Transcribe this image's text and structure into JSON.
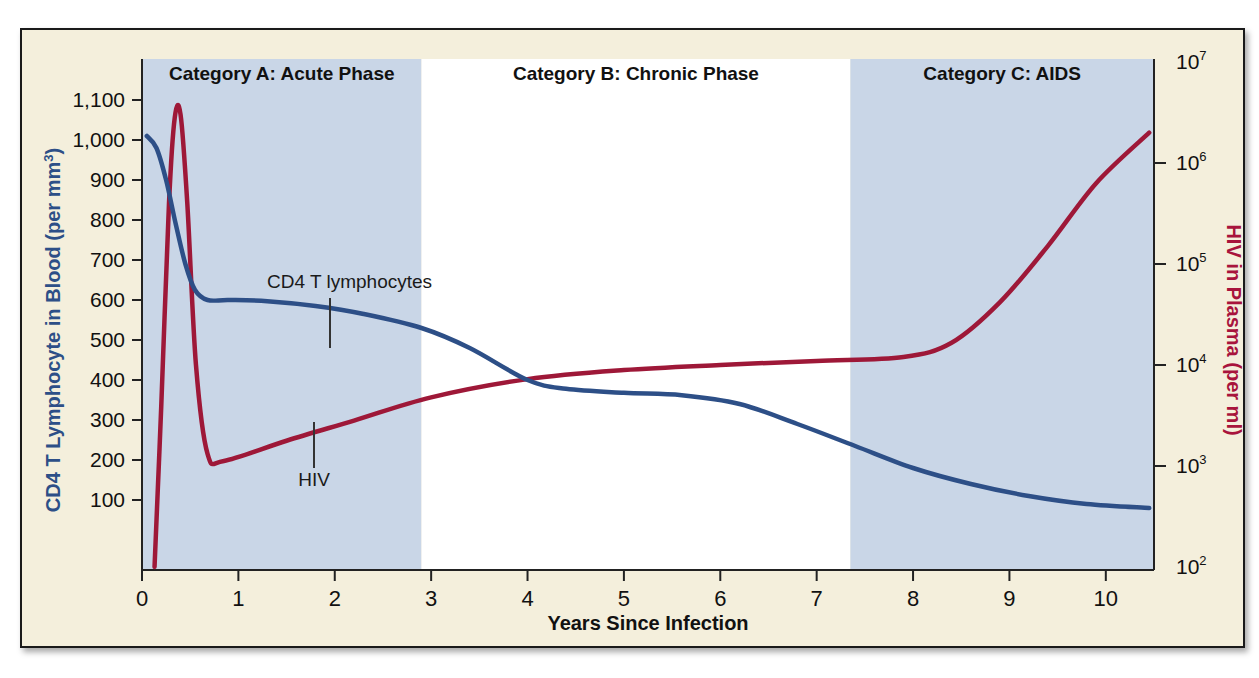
{
  "figure": {
    "background_color": "#f4efdc",
    "border_color": "#1a1a1a",
    "plot_background_color": "#ffffff",
    "shaded_band_color": "#c9d6e7"
  },
  "chart_data": {
    "type": "line",
    "title": "",
    "xlabel": "Years Since Infection",
    "ylabel_left": "CD4 T Lymphocyte in Blood (per mm",
    "ylabel_left_sup": "3",
    "ylabel_left_tail": ")",
    "ylabel_right": "HIV in Plasma (per ml)",
    "xlim": [
      0,
      10.5
    ],
    "xticks": [
      "0",
      "1",
      "2",
      "3",
      "4",
      "5",
      "6",
      "7",
      "8",
      "9",
      "10"
    ],
    "xtick_values": [
      0,
      1,
      2,
      3,
      4,
      5,
      6,
      7,
      8,
      9,
      10
    ],
    "ylim_left": [
      0,
      1200
    ],
    "yticks_left": [
      "1,100",
      "1,000",
      "900",
      "800",
      "700",
      "600",
      "500",
      "400",
      "300",
      "200",
      "100"
    ],
    "ytick_values_left": [
      1100,
      1000,
      900,
      800,
      700,
      600,
      500,
      400,
      300,
      200,
      100
    ],
    "ylim_right_log10": [
      2,
      7
    ],
    "yticks_right": [
      {
        "base": "10",
        "exp": "7",
        "value": 7
      },
      {
        "base": "10",
        "exp": "6",
        "value": 6
      },
      {
        "base": "10",
        "exp": "5",
        "value": 5
      },
      {
        "base": "10",
        "exp": "4",
        "value": 4
      },
      {
        "base": "10",
        "exp": "3",
        "value": 3
      },
      {
        "base": "10",
        "exp": "2",
        "value": 2
      }
    ],
    "grid": false,
    "legend_position": "inline-annotations",
    "bands": [
      {
        "id": "A",
        "label": "Category A:  Acute Phase",
        "x_start": 0,
        "x_end": 2.9,
        "shaded": true
      },
      {
        "id": "B",
        "label": "Category B: Chronic Phase",
        "x_start": 2.9,
        "x_end": 7.35,
        "shaded": false
      },
      {
        "id": "C",
        "label": "Category C: AIDS",
        "x_start": 7.35,
        "x_end": 10.5,
        "shaded": true
      }
    ],
    "series": [
      {
        "name": "CD4 T lymphocytes",
        "color": "#2d4f87",
        "axis": "left",
        "units": "cells per mm^3",
        "annotation": "CD4 T lymphocytes",
        "points": [
          {
            "x": 0.05,
            "y": 1010
          },
          {
            "x": 0.15,
            "y": 980
          },
          {
            "x": 0.25,
            "y": 900
          },
          {
            "x": 0.35,
            "y": 790
          },
          {
            "x": 0.45,
            "y": 690
          },
          {
            "x": 0.55,
            "y": 625
          },
          {
            "x": 0.68,
            "y": 600
          },
          {
            "x": 0.9,
            "y": 600
          },
          {
            "x": 1.3,
            "y": 597
          },
          {
            "x": 1.8,
            "y": 585
          },
          {
            "x": 2.3,
            "y": 565
          },
          {
            "x": 2.9,
            "y": 530
          },
          {
            "x": 3.4,
            "y": 480
          },
          {
            "x": 4.0,
            "y": 400
          },
          {
            "x": 4.4,
            "y": 378
          },
          {
            "x": 5.0,
            "y": 368
          },
          {
            "x": 5.6,
            "y": 362
          },
          {
            "x": 6.2,
            "y": 340
          },
          {
            "x": 6.8,
            "y": 290
          },
          {
            "x": 7.4,
            "y": 235
          },
          {
            "x": 8.0,
            "y": 180
          },
          {
            "x": 8.6,
            "y": 140
          },
          {
            "x": 9.2,
            "y": 110
          },
          {
            "x": 9.8,
            "y": 90
          },
          {
            "x": 10.45,
            "y": 80
          }
        ]
      },
      {
        "name": "HIV",
        "color": "#9e1838",
        "axis": "right",
        "units": "copies per ml",
        "annotation": "HIV",
        "points": [
          {
            "x": 0.13,
            "y_log10": 2.0
          },
          {
            "x": 0.2,
            "y_log10": 3.6
          },
          {
            "x": 0.28,
            "y_log10": 5.6
          },
          {
            "x": 0.34,
            "y_log10": 6.45
          },
          {
            "x": 0.4,
            "y_log10": 6.48
          },
          {
            "x": 0.47,
            "y_log10": 5.6
          },
          {
            "x": 0.56,
            "y_log10": 4.0
          },
          {
            "x": 0.68,
            "y_log10": 3.12
          },
          {
            "x": 0.85,
            "y_log10": 3.05
          },
          {
            "x": 1.5,
            "y_log10": 3.25
          },
          {
            "x": 2.2,
            "y_log10": 3.45
          },
          {
            "x": 3.0,
            "y_log10": 3.68
          },
          {
            "x": 4.0,
            "y_log10": 3.86
          },
          {
            "x": 5.0,
            "y_log10": 3.95
          },
          {
            "x": 6.0,
            "y_log10": 4.0
          },
          {
            "x": 7.0,
            "y_log10": 4.04
          },
          {
            "x": 7.9,
            "y_log10": 4.08
          },
          {
            "x": 8.4,
            "y_log10": 4.22
          },
          {
            "x": 8.9,
            "y_log10": 4.62
          },
          {
            "x": 9.4,
            "y_log10": 5.18
          },
          {
            "x": 9.9,
            "y_log10": 5.8
          },
          {
            "x": 10.45,
            "y_log10": 6.3
          }
        ]
      }
    ],
    "annotations": [
      {
        "text": "CD4 T lymphocytes",
        "x": 1.55,
        "leader_to_x": 1.85,
        "series": "CD4 T lymphocytes"
      },
      {
        "text": "HIV",
        "x": 1.5,
        "leader_to_x": 1.5,
        "series": "HIV"
      }
    ]
  }
}
